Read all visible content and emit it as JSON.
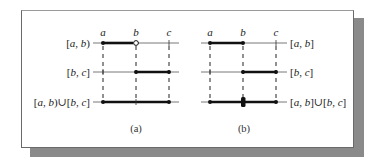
{
  "figure": {
    "panels": [
      {
        "id": "a",
        "caption": "(a)",
        "point_labels": [
          "a",
          "b",
          "c"
        ],
        "rows": [
          {
            "label": "[a, b)",
            "segment": "a-b",
            "left": "closed",
            "right": "open"
          },
          {
            "label": "[b, c]",
            "segment": "b-c",
            "left": "closed",
            "right": "closed"
          },
          {
            "label": "[a, b)∪[b, c]",
            "segment": "a-c",
            "left": "closed",
            "right": "closed"
          }
        ]
      },
      {
        "id": "b",
        "caption": "(b)",
        "point_labels": [
          "a",
          "b",
          "c"
        ],
        "rows": [
          {
            "label": "[a, b]",
            "segment": "a-b",
            "left": "closed",
            "right": "closed"
          },
          {
            "label": "[b, c]",
            "segment": "b-c",
            "left": "closed",
            "right": "closed"
          },
          {
            "label": "[a, b]∪[b, c]",
            "segment": "a-c",
            "left": "closed",
            "right": "closed",
            "overlap_point": "b"
          }
        ]
      }
    ]
  },
  "labels": {
    "a": {
      "pa": "a",
      "pb": "b",
      "pc": "c",
      "r1_pre": "[",
      "r1_v1": "a",
      "r1_mid": ", ",
      "r1_v2": "b",
      "r1_post": ")",
      "r2_pre": "[",
      "r2_v1": "b",
      "r2_mid": ", ",
      "r2_v2": "c",
      "r2_post": "]",
      "r3_pre": "[",
      "r3_v1": "a",
      "r3_mid": ", ",
      "r3_v2": "b",
      "r3_post": ")∪[",
      "r3_v3": "b",
      "r3_mid2": ", ",
      "r3_v4": "c",
      "r3_post2": "]",
      "caption": "(a)"
    },
    "b": {
      "pa": "a",
      "pb": "b",
      "pc": "c",
      "r1_pre": "[",
      "r1_v1": "a",
      "r1_mid": ", ",
      "r1_v2": "b",
      "r1_post": "]",
      "r2_pre": "[",
      "r2_v1": "b",
      "r2_mid": ", ",
      "r2_v2": "c",
      "r2_post": "]",
      "r3_pre": "[",
      "r3_v1": "a",
      "r3_mid": ", ",
      "r3_v2": "b",
      "r3_post": "]∪[",
      "r3_v3": "b",
      "r3_mid2": ", ",
      "r3_v4": "c",
      "r3_post2": "]",
      "caption": "(b)"
    }
  },
  "colors": {
    "line": "#222222",
    "thin_line": "#555555",
    "shadow": "#8a8a8a",
    "frame": "#6a6a6a"
  }
}
